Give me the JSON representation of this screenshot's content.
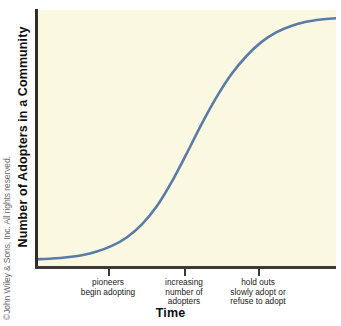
{
  "figure": {
    "background_color": "#ffffff",
    "plot_background_color": "#faf8e0",
    "axis_color": "#3b3b33",
    "curve_color": "#5a7ba6"
  },
  "copyright": {
    "text": "©John Wiley & Sons, Inc. All rights reserved."
  },
  "axes": {
    "ylabel": "Number of Adopters in a Community",
    "xlabel": "Time"
  },
  "tick_labels": [
    "pioneers\nbegin adopting",
    "increasing\nnumber of\nadopters",
    "hold outs\nslowly adopt or\nrefuse to adopt"
  ],
  "chart_data": {
    "type": "line",
    "title": "",
    "subtitle": "",
    "xlabel": "Time",
    "ylabel": "Number of Adopters in a Community",
    "xlim": [
      0,
      100
    ],
    "ylim": [
      0,
      100
    ],
    "grid": false,
    "legend": false,
    "legend_position": "none",
    "axis_tick_labels_x": [
      "pioneers begin adopting",
      "increasing number of adopters",
      "hold outs slowly adopt or refuse to adopt"
    ],
    "x_tick_positions": [
      24,
      49,
      74
    ],
    "y_tick_positions": [],
    "series": [
      {
        "name": "cumulative adopters (S-curve)",
        "color": "#5a7ba6",
        "x": [
          0,
          5,
          10,
          15,
          20,
          25,
          30,
          35,
          40,
          45,
          50,
          55,
          60,
          65,
          70,
          75,
          80,
          85,
          90,
          95,
          100
        ],
        "y": [
          3,
          3.3,
          3.8,
          4.6,
          6,
          8.2,
          11.5,
          16.5,
          23.5,
          33,
          44,
          55.5,
          66,
          75,
          82,
          87.5,
          91.3,
          93.8,
          95.4,
          96.3,
          96.8
        ]
      }
    ],
    "annotations": [
      {
        "x": 24,
        "text": "pioneers begin adopting"
      },
      {
        "x": 49,
        "text": "increasing number of adopters"
      },
      {
        "x": 74,
        "text": "hold outs slowly adopt or refuse to adopt"
      }
    ]
  }
}
